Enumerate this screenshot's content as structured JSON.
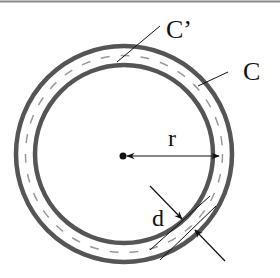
{
  "diagram": {
    "labels": {
      "inner_curve": "C’",
      "outer_curve": "C",
      "radius": "r",
      "thickness": "d"
    },
    "colors": {
      "ring": "#555555",
      "dashed": "#999999",
      "line": "#111111",
      "top_border": "#888888"
    }
  }
}
